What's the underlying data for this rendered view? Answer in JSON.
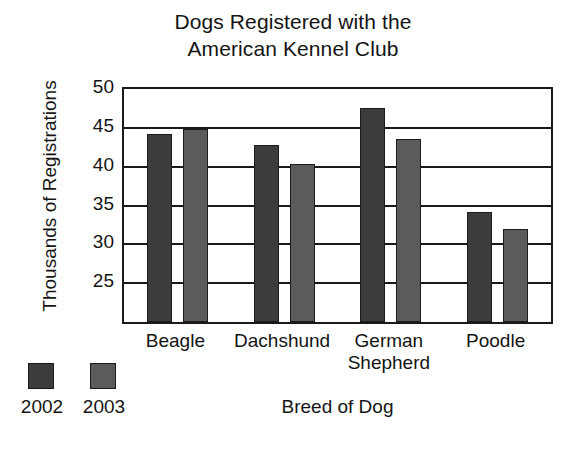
{
  "chart_data": {
    "type": "bar",
    "title": "Dogs Registered with the American Kennel Club",
    "title_lines": [
      "Dogs Registered with the",
      "American Kennel Club"
    ],
    "xlabel": "Breed of Dog",
    "ylabel": "Thousands of Registrations",
    "categories": [
      "Beagle",
      "Dachshund",
      "German Shepherd",
      "Poodle"
    ],
    "category_lines": [
      [
        "Beagle"
      ],
      [
        "Dachshund"
      ],
      [
        "German",
        "Shepherd"
      ],
      [
        "Poodle"
      ]
    ],
    "series": [
      {
        "name": "2002",
        "color": "#3c3c3c",
        "values": [
          44.2,
          42.8,
          47.5,
          34.2
        ]
      },
      {
        "name": "2003",
        "color": "#5b5b5b",
        "values": [
          44.8,
          40.3,
          43.5,
          32.0
        ]
      }
    ],
    "ylim": [
      20,
      50
    ],
    "yticks": [
      50,
      45,
      40,
      35,
      30,
      25
    ],
    "ytick_labels": [
      "50",
      "45",
      "40",
      "35",
      "30",
      "25"
    ],
    "grid": true,
    "grid_axis": "y",
    "legend_position": "bottom-left",
    "bar_border_color": "#1c1c1c",
    "axis_color": "#1a1a1a",
    "background": "#ffffff"
  }
}
